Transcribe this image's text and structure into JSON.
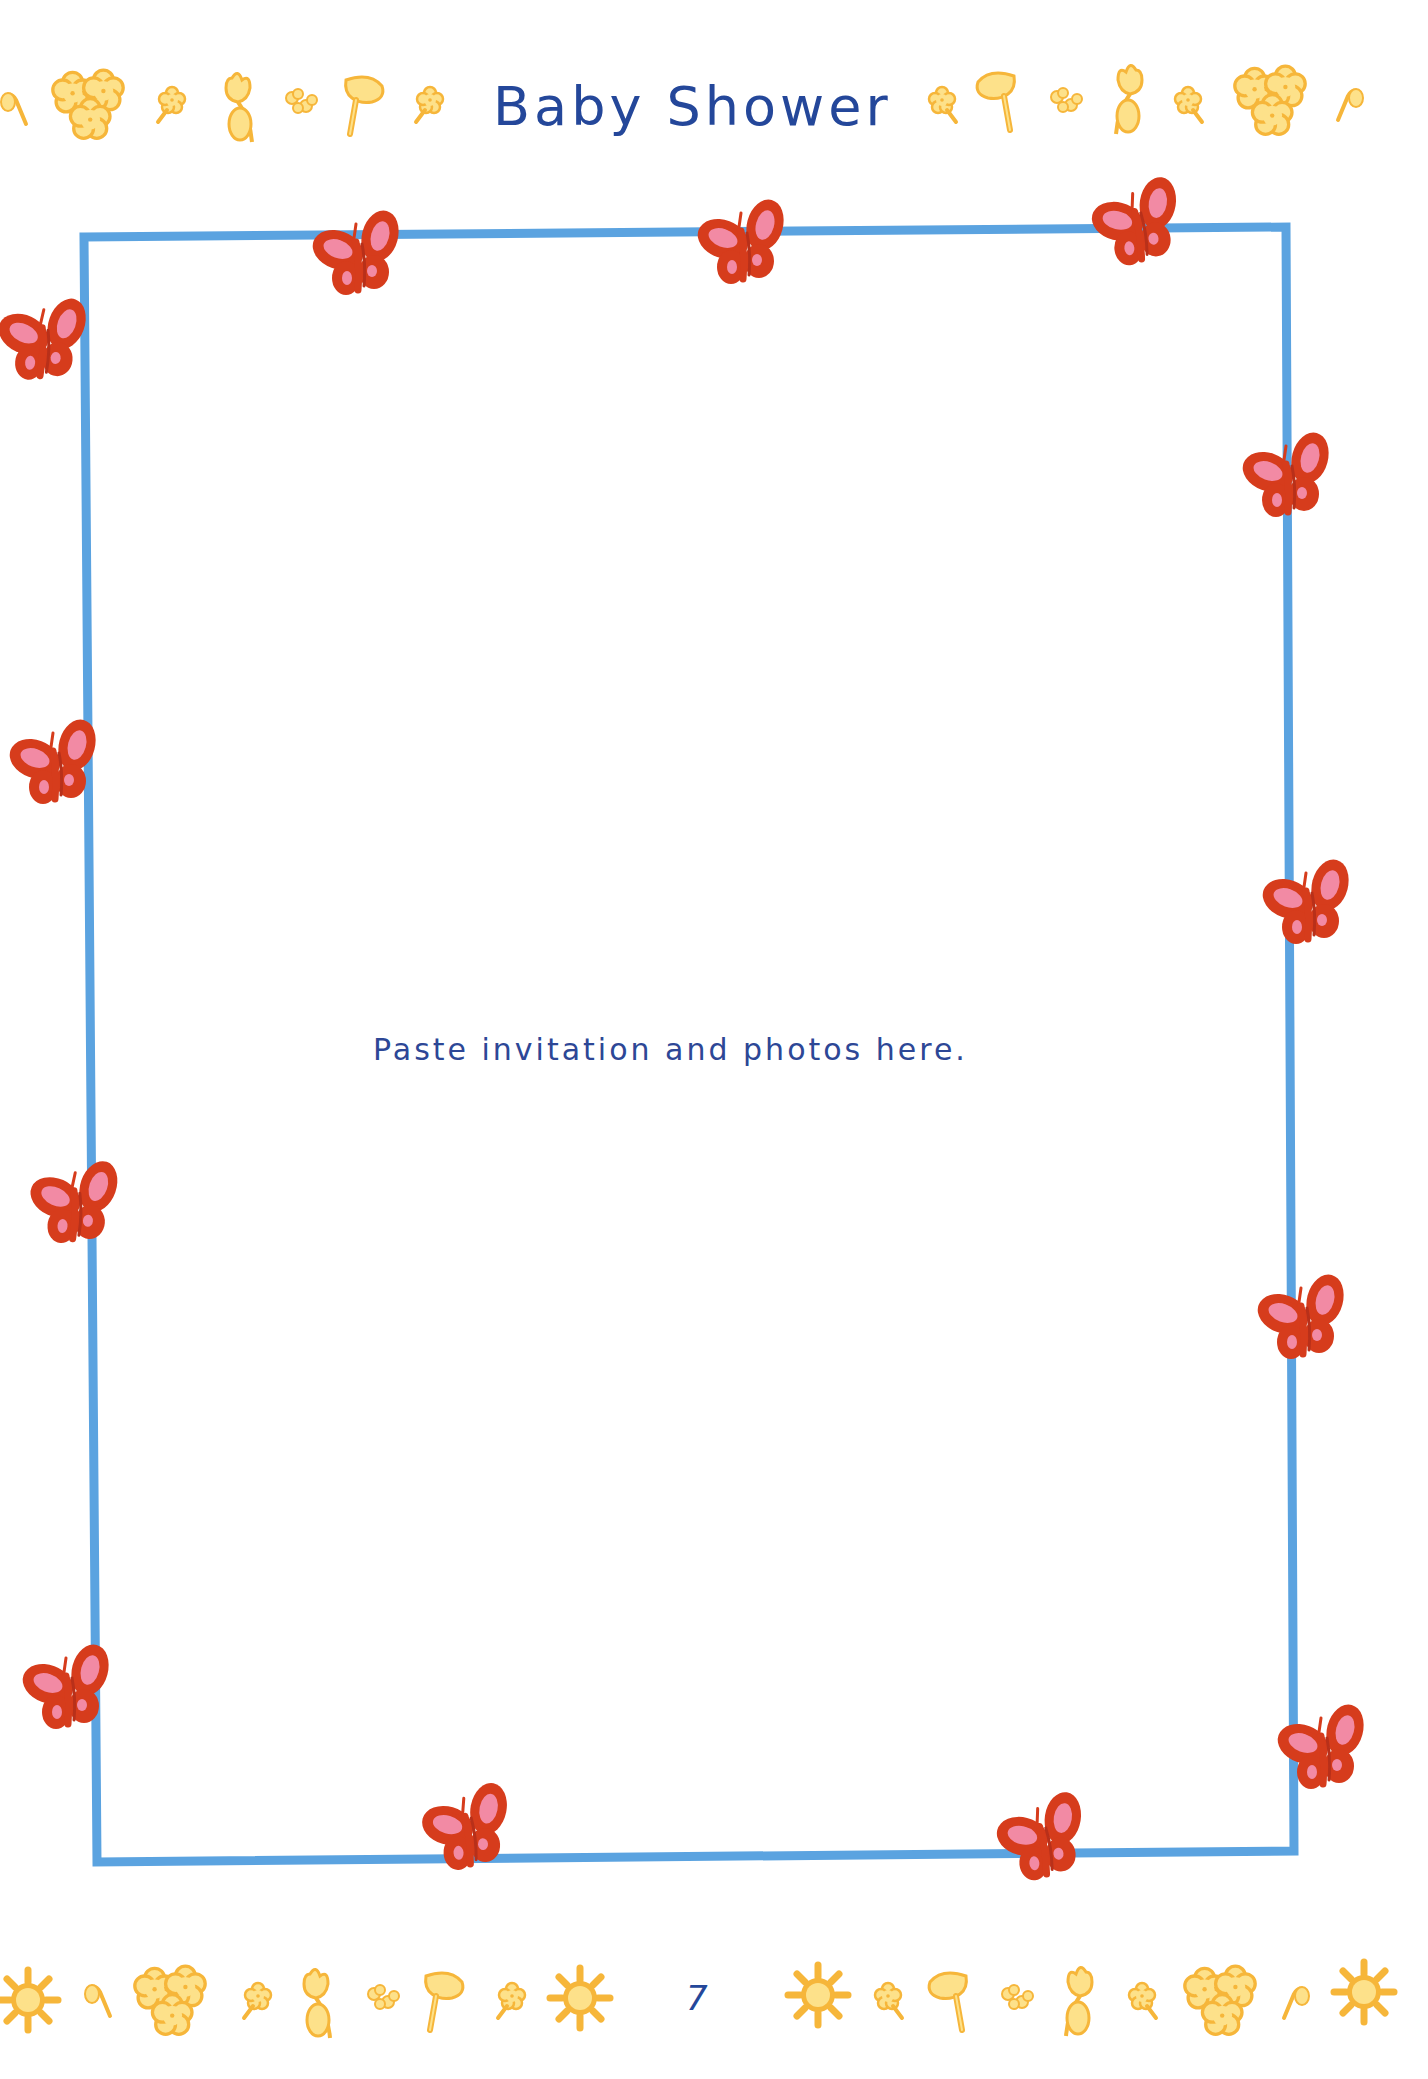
{
  "header": {
    "title": "Baby Shower",
    "decoration_left": [
      "leaf-icon",
      "flower-cluster-icon",
      "flower-icon",
      "tulip-icon",
      "small-flowers-icon",
      "mushroom-flower-icon",
      "flower-icon"
    ],
    "decoration_right": [
      "flower-icon",
      "mushroom-flower-icon",
      "small-flowers-icon",
      "tulip-icon",
      "flower-icon",
      "flower-cluster-icon",
      "leaf-icon"
    ]
  },
  "frame": {
    "instruction": "Paste invitation and photos here.",
    "border_color": "#5ba3e0",
    "butterfly_count": 12
  },
  "footer": {
    "page_number": "7",
    "decoration_left": [
      "sun-icon",
      "leaf-icon",
      "flower-cluster-icon",
      "flower-icon",
      "tulip-icon",
      "small-flowers-icon",
      "mushroom-flower-icon",
      "flower-icon",
      "sun-icon"
    ],
    "decoration_right": [
      "sun-icon",
      "flower-icon",
      "mushroom-flower-icon",
      "small-flowers-icon",
      "tulip-icon",
      "flower-icon",
      "flower-cluster-icon",
      "leaf-icon",
      "sun-icon"
    ]
  },
  "colors": {
    "title_blue": "#24479a",
    "butterfly_red": "#d63c1c",
    "butterfly_pink": "#f28aa4",
    "flower_yellow": "#fde18a",
    "flower_orange": "#f6b63a"
  }
}
